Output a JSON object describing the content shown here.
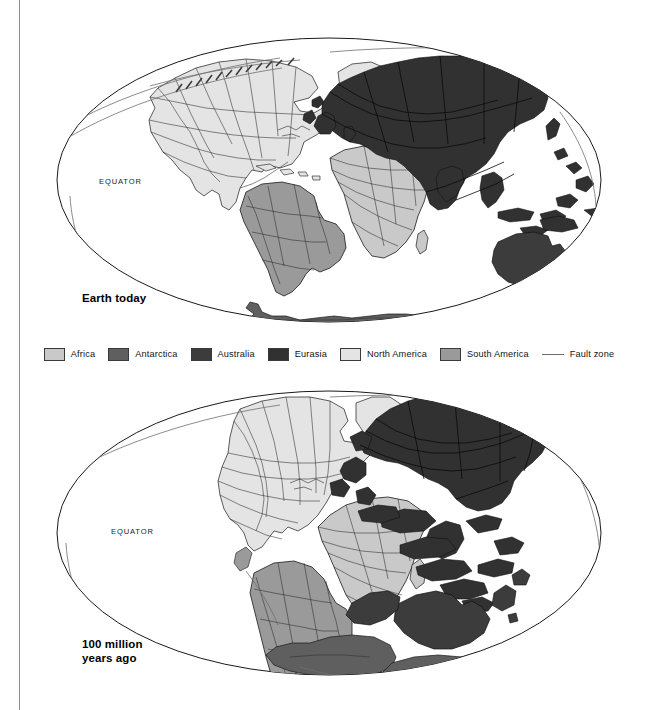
{
  "figure": {
    "background": "#ffffff",
    "rule_color": "#8d8d8d"
  },
  "maps": [
    {
      "id": "today",
      "caption": "Earth today",
      "equator_label": "EQUATOR",
      "projection": "Mollweide"
    },
    {
      "id": "ancient",
      "caption": "100 million\nyears ago",
      "equator_label": "EQUATOR",
      "projection": "Mollweide"
    }
  ],
  "legend": {
    "items": [
      {
        "label": "Africa",
        "color": "#c9c9c9",
        "type": "swatch"
      },
      {
        "label": "Antarctica",
        "color": "#5f5f5f",
        "type": "swatch"
      },
      {
        "label": "Australia",
        "color": "#3c3c3c",
        "type": "swatch"
      },
      {
        "label": "Eurasia",
        "color": "#313131",
        "type": "swatch"
      },
      {
        "label": "North America",
        "color": "#e4e4e4",
        "type": "swatch"
      },
      {
        "label": "South America",
        "color": "#9a9a9a",
        "type": "swatch"
      },
      {
        "label": "Fault zone",
        "color": "#6f6f6f",
        "type": "line"
      }
    ]
  },
  "colors": {
    "africa": "#c9c9c9",
    "antarctica": "#5f5f5f",
    "australia": "#3c3c3c",
    "eurasia": "#313131",
    "north_america": "#e4e4e4",
    "south_america": "#9a9a9a",
    "outline": "#1a1a1a",
    "fault": "#6f6f6f",
    "ocean": "#ffffff"
  }
}
